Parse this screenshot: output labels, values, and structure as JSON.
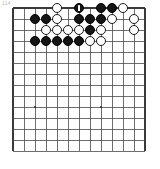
{
  "figure": {
    "caption_mark": "114",
    "type": "go-board-diagram",
    "colors": {
      "board_background": "#ffffff",
      "grid_line": "#4a4a4a",
      "border_line": "#3a3a3a",
      "black_stone": "#151515",
      "white_stone": "#ffffff",
      "white_stone_outline": "#1a1a1a",
      "move_marker": "#ffffff",
      "star_point": "#2b2b2b"
    }
  },
  "board": {
    "columns": 13,
    "rows": 14,
    "cell_size": 11,
    "origin_x": 3,
    "origin_y": 4,
    "star_points": [
      {
        "col": 3,
        "row": 10
      },
      {
        "col": 9,
        "row": 10
      }
    ],
    "stones": [
      {
        "col": 5,
        "row": 1,
        "color": "white"
      },
      {
        "col": 7,
        "row": 1,
        "color": "black",
        "marked": true,
        "move_label": "last-move"
      },
      {
        "col": 9,
        "row": 1,
        "color": "black"
      },
      {
        "col": 10,
        "row": 1,
        "color": "black"
      },
      {
        "col": 11,
        "row": 1,
        "color": "white"
      },
      {
        "col": 3,
        "row": 2,
        "color": "black"
      },
      {
        "col": 4,
        "row": 2,
        "color": "black"
      },
      {
        "col": 5,
        "row": 2,
        "color": "white"
      },
      {
        "col": 7,
        "row": 2,
        "color": "black"
      },
      {
        "col": 8,
        "row": 2,
        "color": "black"
      },
      {
        "col": 9,
        "row": 2,
        "color": "black"
      },
      {
        "col": 10,
        "row": 2,
        "color": "white"
      },
      {
        "col": 12,
        "row": 2,
        "color": "white"
      },
      {
        "col": 4,
        "row": 3,
        "color": "white"
      },
      {
        "col": 5,
        "row": 3,
        "color": "white"
      },
      {
        "col": 6,
        "row": 3,
        "color": "white"
      },
      {
        "col": 7,
        "row": 3,
        "color": "white"
      },
      {
        "col": 8,
        "row": 3,
        "color": "black"
      },
      {
        "col": 9,
        "row": 3,
        "color": "white"
      },
      {
        "col": 12,
        "row": 3,
        "color": "white"
      },
      {
        "col": 3,
        "row": 4,
        "color": "black"
      },
      {
        "col": 4,
        "row": 4,
        "color": "black"
      },
      {
        "col": 5,
        "row": 4,
        "color": "black"
      },
      {
        "col": 6,
        "row": 4,
        "color": "black"
      },
      {
        "col": 7,
        "row": 4,
        "color": "black"
      },
      {
        "col": 8,
        "row": 4,
        "color": "white"
      },
      {
        "col": 9,
        "row": 4,
        "color": "white"
      }
    ]
  }
}
